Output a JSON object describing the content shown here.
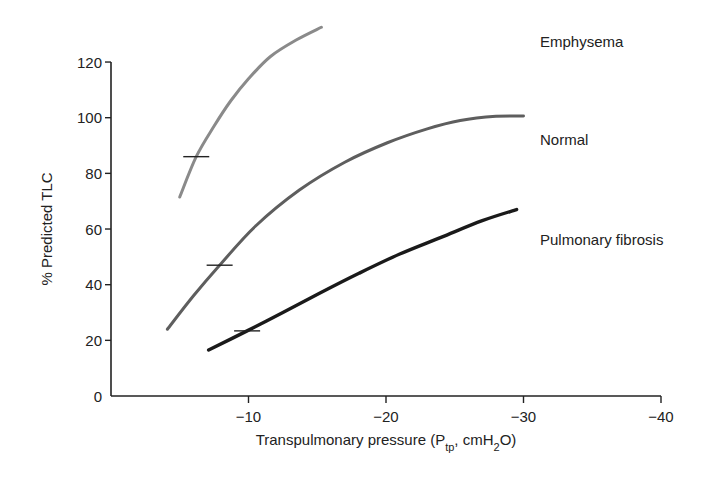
{
  "chart_data": {
    "type": "line",
    "title": "",
    "xlabel": "Transpulmonary pressure (Ptp, cmH2O)",
    "xlabel_parts": {
      "main": "Transpulmonary pressure (P",
      "sub1": "tp",
      "mid": ", cmH",
      "sub2": "2",
      "end": "O)"
    },
    "ylabel": "% Predicted TLC",
    "xlim": [
      0,
      -40
    ],
    "ylim": [
      0,
      130
    ],
    "x_ticks": [
      -10,
      -20,
      -30,
      -40
    ],
    "x_tick_labels": [
      "−10",
      "−20",
      "−30",
      "−40"
    ],
    "y_ticks": [
      0,
      20,
      40,
      60,
      80,
      100,
      120
    ],
    "y_tick_labels": [
      "0",
      "20",
      "40",
      "60",
      "80",
      "100",
      "120"
    ],
    "grid": false,
    "legend": "inline labels at right",
    "series": [
      {
        "name": "Emphysema",
        "color": "#8a8a8a",
        "x": [
          -5.0,
          -6.2,
          -7.5,
          -8.7,
          -10.0,
          -11.6,
          -13.5,
          -15.3
        ],
        "y": [
          71.5,
          86,
          97,
          106,
          114,
          122,
          128,
          132.5
        ],
        "marker": {
          "x": -6.2,
          "y": 86
        }
      },
      {
        "name": "Normal",
        "color": "#5e5e5e",
        "x": [
          -4.1,
          -6.0,
          -7.9,
          -10.5,
          -13.7,
          -17.0,
          -20.1,
          -23.0,
          -25.4,
          -28.0,
          -30.0
        ],
        "y": [
          24,
          36,
          47,
          61,
          74,
          84,
          91,
          96,
          99,
          100.5,
          100.6
        ],
        "marker": {
          "x": -7.9,
          "y": 47
        }
      },
      {
        "name": "Pulmonary fibrosis",
        "color": "#1a1a1a",
        "x": [
          -7.1,
          -9.9,
          -12.5,
          -15.2,
          -18.0,
          -21.0,
          -24.0,
          -27.0,
          -29.5
        ],
        "y": [
          16.5,
          23.4,
          30,
          37,
          44,
          51,
          57,
          63,
          67
        ],
        "marker": {
          "x": -9.9,
          "y": 23.4
        }
      }
    ]
  }
}
